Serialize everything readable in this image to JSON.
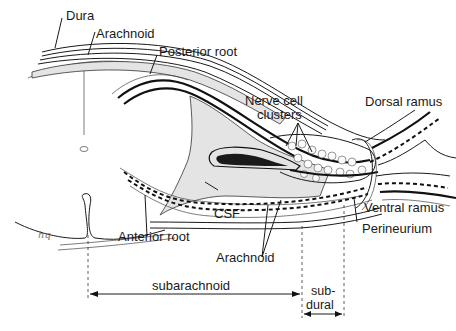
{
  "figure": {
    "labels": {
      "dura": "Dura",
      "arachnoid_top": "Arachnoid",
      "posterior_root": "Posterior root",
      "nerve_cell_clusters_line1": "Nerve cell",
      "nerve_cell_clusters_line2": "clusters",
      "dorsal_ramus": "Dorsal ramus",
      "ventral_ramus": "Ventral ramus",
      "perineurium": "Perineurium",
      "csf": "CSF",
      "anterior_root": "Anterior root",
      "arachnoid_bottom": "Arachnoid"
    },
    "dimensions": {
      "subarachnoid": "subarachnoid",
      "subdural_line1": "sub-",
      "subdural_line2": "dural"
    },
    "signature": "hq"
  }
}
